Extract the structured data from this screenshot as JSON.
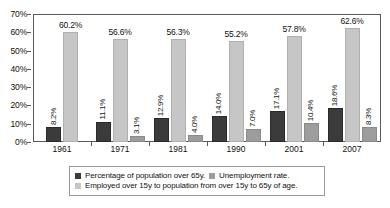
{
  "chart_data": {
    "type": "bar",
    "title": "",
    "xlabel": "",
    "ylabel": "",
    "ylim": [
      0,
      70
    ],
    "ytick_labels": [
      "0%",
      "10%",
      "20%",
      "30%",
      "40%",
      "50%",
      "60%",
      "70%"
    ],
    "ytick_values": [
      0,
      10,
      20,
      30,
      40,
      50,
      60,
      70
    ],
    "grid": false,
    "legend_position": "bottom",
    "categories": [
      "1961",
      "1971",
      "1981",
      "1990",
      "2001",
      "2007"
    ],
    "series": [
      {
        "name": "Percentage of population over 65y.",
        "color": "#3b3b3b",
        "values": [
          8.2,
          11.1,
          12.9,
          14.0,
          17.1,
          18.6
        ],
        "labels": [
          "8.2%",
          "11.1%",
          "12.9%",
          "14.0%",
          "17.1%",
          "18.6%"
        ]
      },
      {
        "name": "Employed over 15y to population from over 15y to 65y of age.",
        "color": "#c6c6c6",
        "values": [
          60.2,
          56.6,
          56.3,
          55.2,
          57.8,
          62.6
        ],
        "labels": [
          "60.2%",
          "56.6%",
          "56.3%",
          "55.2%",
          "57.8%",
          "62.6%"
        ]
      },
      {
        "name": "Unemployment rate.",
        "color": "#9d9d9d",
        "values": [
          null,
          3.1,
          4.0,
          7.0,
          10.4,
          8.3
        ],
        "labels": [
          "",
          "3.1%",
          "4.0%",
          "7.0%",
          "10.4%",
          "8.3%"
        ]
      }
    ]
  },
  "legend": {
    "items": [
      {
        "label": "Percentage of population over 65y.",
        "swatch": "dark"
      },
      {
        "label": "Unemployment rate.",
        "swatch": "mid"
      },
      {
        "label": "Employed over 15y to population from over 15y to 65y of age.",
        "swatch": "light"
      }
    ]
  }
}
